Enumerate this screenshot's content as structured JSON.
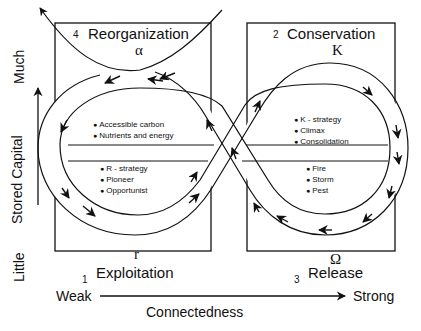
{
  "quadrants": {
    "reorganization": {
      "number": "4",
      "name": "Reorganization",
      "symbol": "α",
      "items": [
        "Accessible carbon",
        "Nutrients and energy"
      ]
    },
    "conservation": {
      "number": "2",
      "name": "Conservation",
      "symbol": "K",
      "items": [
        "K - strategy",
        "Climax",
        "Consolidation"
      ]
    },
    "exploitation": {
      "number": "1",
      "name": "Exploitation",
      "symbol": "r",
      "items": [
        "R - strategy",
        "Pioneer",
        "Opportunist"
      ]
    },
    "release": {
      "number": "3",
      "name": "Release",
      "symbol": "Ω",
      "items": [
        "Fire",
        "Storm",
        "Pest"
      ]
    }
  },
  "axes": {
    "y_label": "Stored Capital",
    "y_high": "Much",
    "y_low": "Little",
    "x_label": "Connectedness",
    "x_low": "Weak",
    "x_high": "Strong"
  },
  "colors": {
    "ink": "#111111",
    "background": "#ffffff"
  }
}
